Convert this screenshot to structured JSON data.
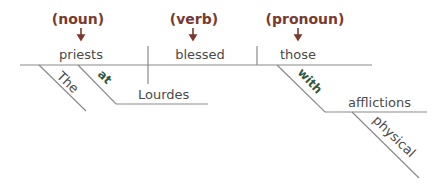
{
  "diagram": {
    "type": "sentence-diagram",
    "labels": {
      "subject_pos": "(noun)",
      "verb_pos": "(verb)",
      "object_pos": "(pronoun)"
    },
    "main_line": {
      "subject": "priests",
      "verb": "blessed",
      "object": "those"
    },
    "modifiers": {
      "subject_article": "The",
      "subject_preposition": "at",
      "subject_prep_object": "Lourdes",
      "object_preposition": "with",
      "object_prep_object": "afflictions",
      "prep_object_adjective": "physical"
    },
    "colors": {
      "pos_label": "#7a3a2e",
      "word": "#4a4a4a",
      "preposition": "#2f5a46",
      "line": "#8a8a8a"
    }
  }
}
